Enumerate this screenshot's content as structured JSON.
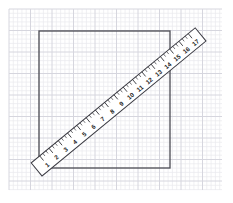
{
  "canvas": {
    "width": 233,
    "height": 203,
    "background_color": "#ffffff"
  },
  "grid": {
    "name": "graph-paper-grid",
    "origin_x": 9,
    "origin_y": 9,
    "width": 213,
    "height": 181,
    "minor_cell_px": 4.3,
    "major_every": 5,
    "minor_color": "#e9e9ee",
    "major_color": "#d6d6de"
  },
  "square": {
    "name": "square-outline",
    "left": 39,
    "top": 31,
    "width": 131,
    "height": 137,
    "stroke_color": "#4a4a52",
    "stroke_width": 1.3,
    "fill": "none"
  },
  "ruler": {
    "name": "ruler",
    "start_x": 42,
    "start_y": 176,
    "end_x": 206,
    "end_y": 41,
    "thickness": 17,
    "angle_deg": -39.5,
    "body_fill": "#ffffff",
    "body_stroke": "#3a3a42",
    "body_stroke_width": 1,
    "tick_color": "#2a2a30",
    "label_color": "#1a1a1a",
    "label_font_size": 6.2,
    "major_labels": [
      "1",
      "2",
      "3",
      "4",
      "5",
      "6",
      "7",
      "8",
      "9",
      "10",
      "11",
      "12",
      "13",
      "14",
      "15",
      "16",
      "17"
    ],
    "major_tick_count": 17,
    "minor_ticks_per_major": 2,
    "units": "cm"
  }
}
